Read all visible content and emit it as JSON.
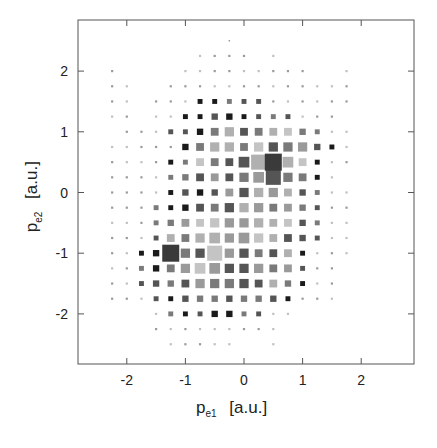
{
  "chart_data": {
    "type": "heatmap",
    "title": "",
    "xlabel": "p_e1 [a.u.]",
    "ylabel": "p_e2 [a.u.]",
    "xlabel_main": "p",
    "xlabel_sub": "e1",
    "xlabel_unit": "[a.u.]",
    "ylabel_main": "p",
    "ylabel_sub": "e2",
    "ylabel_unit": "[a.u.]",
    "xlim": [
      -2.75,
      2.95
    ],
    "ylim": [
      -2.8,
      2.8
    ],
    "xticks": [
      -2,
      -1,
      0,
      1,
      2
    ],
    "yticks": [
      2,
      1,
      0,
      -1,
      -2
    ],
    "grid": false,
    "legend": null,
    "cell_step": 0.25,
    "x_start": -2.25,
    "y_start": 2.5,
    "encoding": "each cell is a gray square; digit 0-9 = relative square size (0 = empty); letter = shade: d=dark, m=medium, l=light",
    "rows": [
      "........0..........",
      "......1111.1.......",
      "1....111111111..1..",
      "11..1111111111111..",
      "11.11122222111111..",
      "11.1122332222111...",
      ".1112234544443211..",
      "11111345545555321..",
      "11112244469664211..",
      "1111234445695421...",
      "11112333455543211..",
      "11122344555443211..",
      "11123445555443211..",
      "11124456565443211..",
      "11234559554442111..",
      "1123456655544211...",
      "1123345555443211...",
      "1112233333332111...",
      "...1222332211......",
      "...111111111.......",
      "....11111..1......."
    ],
    "highlights": [
      {
        "x": 0.5,
        "y": 0.5,
        "value": "max",
        "shade": "#3a3a3a"
      },
      {
        "x": -1.25,
        "y": -1.0,
        "value": "max",
        "shade": "#3a3a3a"
      }
    ],
    "colors": {
      "dark": "#1a1a1a",
      "medium": "#6e6e6e",
      "light": "#a9a9a9",
      "lighter": "#cfcfcf",
      "frame": "#555555"
    }
  }
}
